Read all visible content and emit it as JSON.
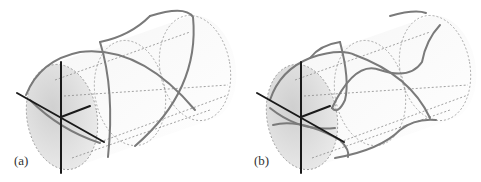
{
  "figure": {
    "panels": [
      {
        "id": "a",
        "label": "(a)"
      },
      {
        "id": "b",
        "label": "(b)"
      }
    ]
  },
  "colors": {
    "axis": "#1a1a1a",
    "curve": "#7a7a7a",
    "dotted": "#8a8a8a",
    "front_disk_fill": "#d6d6d6",
    "cylinder_fill": "#f2f2f2"
  }
}
